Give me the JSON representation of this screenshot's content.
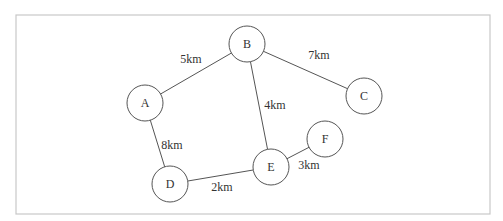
{
  "diagram": {
    "type": "weighted-undirected-graph",
    "colors": {
      "frame": "#c8c8c8",
      "stroke": "#555555",
      "text": "#333333",
      "background": "#ffffff"
    },
    "frame": {
      "x": 16,
      "y": 15,
      "width": 474,
      "height": 199
    },
    "node_radius": 18,
    "nodes": [
      {
        "id": "A",
        "label": "A",
        "x": 145,
        "y": 103
      },
      {
        "id": "B",
        "label": "B",
        "x": 247,
        "y": 44
      },
      {
        "id": "C",
        "label": "C",
        "x": 364,
        "y": 96
      },
      {
        "id": "D",
        "label": "D",
        "x": 170,
        "y": 184
      },
      {
        "id": "E",
        "label": "E",
        "x": 271,
        "y": 167
      },
      {
        "id": "F",
        "label": "F",
        "x": 325,
        "y": 139
      }
    ],
    "edges": [
      {
        "from": "A",
        "to": "B",
        "label": "5km",
        "label_x": 191,
        "label_y": 59
      },
      {
        "from": "B",
        "to": "C",
        "label": "7km",
        "label_x": 319,
        "label_y": 55
      },
      {
        "from": "B",
        "to": "E",
        "label": "4km",
        "label_x": 275,
        "label_y": 105
      },
      {
        "from": "A",
        "to": "D",
        "label": "8km",
        "label_x": 172,
        "label_y": 145
      },
      {
        "from": "D",
        "to": "E",
        "label": "2km",
        "label_x": 222,
        "label_y": 187
      },
      {
        "from": "E",
        "to": "F",
        "label": "3km",
        "label_x": 309,
        "label_y": 165
      }
    ]
  }
}
